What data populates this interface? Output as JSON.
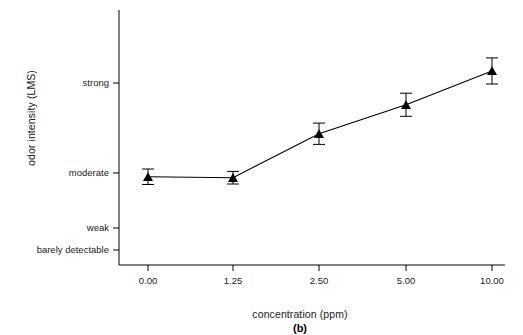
{
  "chart_data": {
    "type": "line",
    "title": "",
    "panel_label": "(b)",
    "xlabel": "concentration (ppm)",
    "ylabel": "odor intensity (LMS)",
    "x_tick_labels": [
      "0.00",
      "1.25",
      "2.50",
      "5.00",
      "10.00"
    ],
    "y_tick_labels": [
      "barely detectable",
      "weak",
      "moderate",
      "strong"
    ],
    "y_tick_values": [
      0,
      1,
      2,
      3
    ],
    "ylim": [
      -0.35,
      4.05
    ],
    "grid": false,
    "legend": null,
    "marker": "triangle-up",
    "series": [
      {
        "name": "odor intensity",
        "categories": [
          "0.00",
          "1.25",
          "2.50",
          "5.00",
          "10.00"
        ],
        "values": [
          1.06,
          1.04,
          1.95,
          2.55,
          3.25
        ],
        "error_low": [
          0.16,
          0.13,
          0.22,
          0.24,
          0.27
        ],
        "error_high": [
          0.16,
          0.13,
          0.22,
          0.24,
          0.27
        ]
      }
    ]
  }
}
